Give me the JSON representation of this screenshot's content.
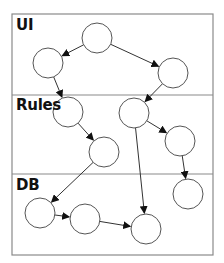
{
  "diagram": {
    "lanes": [
      {
        "id": "ui",
        "label": "UI",
        "y0": 14,
        "y1": 95
      },
      {
        "id": "rules",
        "label": "Rules",
        "y0": 95,
        "y1": 174
      },
      {
        "id": "db",
        "label": "DB",
        "y0": 174,
        "y1": 255
      }
    ],
    "frame": {
      "x": 12,
      "y": 14,
      "width": 201,
      "height": 241,
      "border_color": "#8a8a8a"
    },
    "node_style": {
      "radius": 15,
      "stroke": "#555555",
      "fill": "#ffffff"
    },
    "nodes": [
      {
        "id": "ui-top",
        "lane": "ui",
        "cx": 97,
        "cy": 38
      },
      {
        "id": "ui-left",
        "lane": "ui",
        "cx": 48,
        "cy": 63
      },
      {
        "id": "ui-right",
        "lane": "ui",
        "cx": 173,
        "cy": 73
      },
      {
        "id": "rules-a",
        "lane": "rules",
        "cx": 68,
        "cy": 112
      },
      {
        "id": "rules-b",
        "lane": "rules",
        "cx": 104,
        "cy": 152
      },
      {
        "id": "rules-c",
        "lane": "rules",
        "cx": 134,
        "cy": 113
      },
      {
        "id": "rules-d",
        "lane": "rules",
        "cx": 180,
        "cy": 141
      },
      {
        "id": "db-a",
        "lane": "db",
        "cx": 40,
        "cy": 213
      },
      {
        "id": "db-b",
        "lane": "db",
        "cx": 85,
        "cy": 219
      },
      {
        "id": "db-c",
        "lane": "db",
        "cx": 146,
        "cy": 229
      },
      {
        "id": "db-d",
        "lane": "db",
        "cx": 188,
        "cy": 194
      }
    ],
    "edges": [
      {
        "from": "ui-top",
        "to": "ui-left"
      },
      {
        "from": "ui-top",
        "to": "ui-right"
      },
      {
        "from": "ui-left",
        "to": "rules-a"
      },
      {
        "from": "ui-right",
        "to": "rules-c"
      },
      {
        "from": "rules-a",
        "to": "rules-b"
      },
      {
        "from": "rules-c",
        "to": "rules-d"
      },
      {
        "from": "rules-b",
        "to": "db-a"
      },
      {
        "from": "rules-c",
        "to": "db-c"
      },
      {
        "from": "rules-d",
        "to": "db-d"
      },
      {
        "from": "db-a",
        "to": "db-b"
      },
      {
        "from": "db-b",
        "to": "db-c"
      }
    ],
    "edge_color": "#333333",
    "arrowhead_color": "#111111"
  }
}
